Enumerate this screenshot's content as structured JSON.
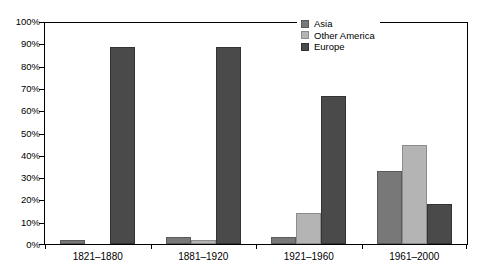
{
  "chart_data": {
    "type": "bar",
    "title": "",
    "subtitle": "",
    "xlabel": "",
    "ylabel": "",
    "categories": [
      "1821–1880",
      "1881–1920",
      "1921–1960",
      "1961–2000"
    ],
    "series": [
      {
        "name": "Asia",
        "color": "#787878",
        "values": [
          2,
          3,
          3,
          33
        ]
      },
      {
        "name": "Other America",
        "color": "#b4b4b4",
        "values": [
          0,
          2,
          14,
          45
        ]
      },
      {
        "name": "Europe",
        "color": "#4a4a4a",
        "values": [
          89,
          89,
          67,
          18
        ]
      }
    ],
    "ylim": [
      0,
      100
    ],
    "y_tick_values": [
      0,
      10,
      20,
      30,
      40,
      50,
      60,
      70,
      80,
      90,
      100
    ],
    "y_tick_labels": [
      "0%",
      "10%",
      "20%",
      "30%",
      "40%",
      "50%",
      "60%",
      "70%",
      "80%",
      "90%",
      "100%"
    ],
    "grid": false,
    "legend_position": "top-right",
    "legend_entries": [
      "Asia",
      "Other America",
      "Europe"
    ]
  },
  "axis": {
    "y_labels": [
      "100%",
      "90%",
      "80%",
      "70%",
      "60%",
      "50%",
      "40%",
      "30%",
      "20%",
      "10%",
      "0%"
    ],
    "x_labels": [
      "1821–1880",
      "1881–1920",
      "1921–1960",
      "1961–2000"
    ]
  },
  "legend": {
    "items": [
      {
        "label": "Asia"
      },
      {
        "label": "Other America"
      },
      {
        "label": "Europe"
      }
    ]
  }
}
